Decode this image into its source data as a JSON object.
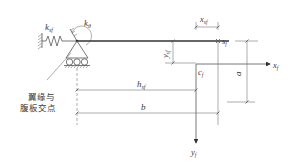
{
  "diagram": {
    "labels": {
      "spring_stiffness": "k",
      "spring_stiffness_sub": "sf",
      "rotational_stiffness": "k",
      "rotational_stiffness_sub": "θ",
      "shear_center": "s",
      "shear_center_sub": "f",
      "x_offset": "x",
      "x_offset_sub": "sf",
      "y_offset": "y",
      "y_offset_sub": "sf",
      "centroid": "c",
      "centroid_sub": "f",
      "x_axis": "x",
      "x_axis_sub": "f",
      "y_axis": "y",
      "y_axis_sub": "f",
      "dim_a": "a",
      "dim_hsf": "h",
      "dim_hsf_sub": "sf",
      "dim_b": "b"
    },
    "annotation": {
      "line1": "翼缘与",
      "line2": "腹板交点"
    },
    "colors": {
      "line": "#555555",
      "text": "#3a3a3a",
      "background": "#ffffff"
    }
  }
}
